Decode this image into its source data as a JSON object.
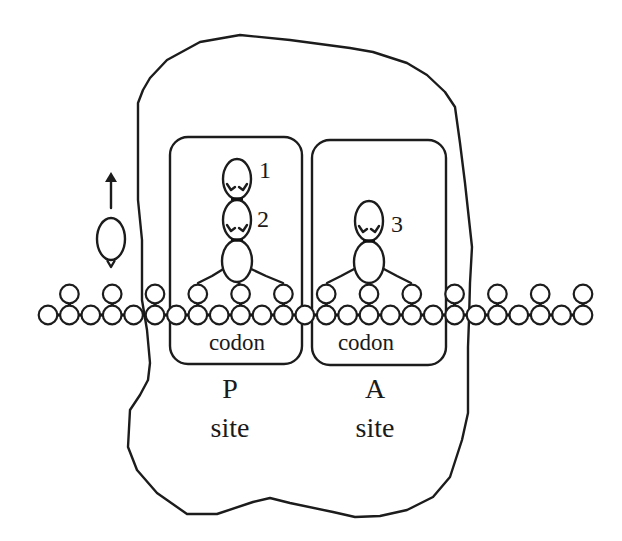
{
  "figure": {
    "p_site": {
      "codon_label": "codon",
      "letter": "P",
      "word": "site"
    },
    "a_site": {
      "codon_label": "codon",
      "letter": "A",
      "word": "site"
    },
    "trna_labels": {
      "one": "1",
      "two": "2",
      "three": "3"
    },
    "mrna": {
      "bead_count": 26,
      "first_x": 48,
      "spacing": 21.4,
      "lower_y": 315,
      "upper_y": 294,
      "radius": 9.3
    },
    "colors": {
      "ink": "#1c1c1c",
      "background": "#ffffff"
    }
  }
}
